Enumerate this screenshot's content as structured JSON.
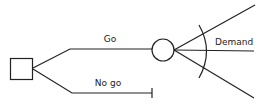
{
  "diagram": {
    "type": "decision-tree",
    "nodes": {
      "decision": {
        "shape": "square",
        "label": ""
      },
      "chance": {
        "shape": "circle",
        "label": ""
      }
    },
    "branches": {
      "go": {
        "label": "Go"
      },
      "no_go": {
        "label": "No go"
      },
      "demand": {
        "label": "Demand",
        "outcomes": 3
      }
    },
    "colors": {
      "line": "#222222",
      "background": "#ffffff"
    }
  }
}
